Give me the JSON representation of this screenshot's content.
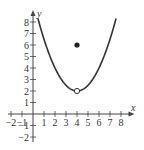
{
  "chart_data": {
    "type": "line",
    "title": "",
    "xlabel": "x",
    "ylabel": "y",
    "xlim": [
      -2.5,
      8.5
    ],
    "ylim": [
      -2.5,
      8.5
    ],
    "x_ticks": [
      "-2",
      "-1",
      "1",
      "2",
      "3",
      "4",
      "5",
      "6",
      "7",
      "8"
    ],
    "y_ticks": [
      "-2",
      "-1",
      "1",
      "2",
      "3",
      "4",
      "5",
      "6",
      "7",
      "8"
    ],
    "grid": false,
    "series": [
      {
        "name": "f(x)",
        "kind": "parabola",
        "equation_estimate": "y = 0.5*(x-4)^2 + 2",
        "x": [
          0.5,
          1,
          2,
          3,
          4,
          5,
          6,
          7,
          7.5
        ],
        "y": [
          8.1,
          6.5,
          4,
          2.5,
          2,
          2.5,
          4,
          6.5,
          8.1
        ]
      }
    ],
    "points": [
      {
        "x": 4,
        "y": 2,
        "style": "open",
        "label": "hole"
      },
      {
        "x": 4,
        "y": 6,
        "style": "filled",
        "label": "defined value"
      }
    ]
  },
  "labels": {
    "x_axis": "x",
    "y_axis": "y"
  }
}
